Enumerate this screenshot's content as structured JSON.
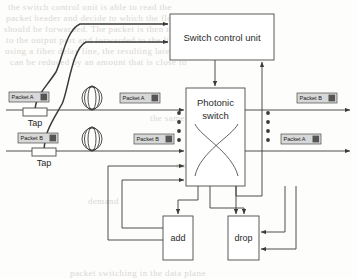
{
  "figure": {
    "type": "block-diagram"
  },
  "blocks": {
    "control_unit": {
      "label": "Switch control unit",
      "x": 170,
      "y": 14,
      "w": 104,
      "h": 46
    },
    "photonic_switch": {
      "label_line1": "Photonic",
      "label_line2": "switch",
      "x": 186,
      "y": 88,
      "w": 59,
      "h": 98
    },
    "add": {
      "label": "add",
      "x": 163,
      "y": 216,
      "w": 30,
      "h": 44
    },
    "drop": {
      "label": "drop",
      "x": 228,
      "y": 216,
      "w": 31,
      "h": 44
    }
  },
  "taps": [
    {
      "label": "Tap",
      "x": 23,
      "y": 108,
      "w": 24,
      "h": 8
    },
    {
      "label": "Tap",
      "x": 32,
      "y": 148,
      "w": 24,
      "h": 8
    }
  ],
  "packets": [
    {
      "id": "in-a",
      "label": "Packet A",
      "x": 9,
      "y": 92,
      "w": 40,
      "h": 10,
      "position": "input-line-1"
    },
    {
      "id": "in-b",
      "label": "Packet B",
      "x": 18,
      "y": 133,
      "w": 40,
      "h": 10,
      "position": "input-line-2"
    },
    {
      "id": "mid-a",
      "label": "Packet A",
      "x": 120,
      "y": 93,
      "w": 40,
      "h": 10,
      "position": "delayed-line-1"
    },
    {
      "id": "mid-b",
      "label": "Packet B",
      "x": 134,
      "y": 134,
      "w": 40,
      "h": 10,
      "position": "delayed-line-2"
    },
    {
      "id": "out-b",
      "label": "Packet B",
      "x": 297,
      "y": 93,
      "w": 40,
      "h": 10,
      "position": "output-line-1"
    },
    {
      "id": "out-a",
      "label": "Packet A",
      "x": 281,
      "y": 134,
      "w": 40,
      "h": 10,
      "position": "output-line-2"
    }
  ],
  "delay_coils": [
    {
      "id": "coil-1",
      "cx": 92,
      "cy": 98,
      "rx": 9,
      "ry": 12,
      "name": "fiber-delay-line-1"
    },
    {
      "id": "coil-2",
      "cx": 92,
      "cy": 139,
      "rx": 9,
      "ry": 12,
      "name": "fiber-delay-line-2"
    }
  ],
  "ellipsis": {
    "left": {
      "x": 179,
      "ys": [
        113,
        122,
        131,
        140
      ],
      "count": 4
    },
    "right": {
      "x": 268,
      "ys": [
        113,
        122,
        131,
        140
      ],
      "count": 4
    }
  },
  "colors": {
    "line": "#3a3a3a",
    "box_fill": "#ffffff",
    "box_stroke": "#4a4a4a",
    "packet_fill": "#d8d8d8",
    "packet_marker": "#555555",
    "text": "#1f1f1f",
    "background": "#fdfdfc",
    "bleed_text": "#cfcbc6"
  },
  "background_bleed": [
    {
      "text": "the switch control unit is able to read the",
      "x": 8,
      "y": 2
    },
    {
      "text": "packet header and decide to which the flow",
      "x": 6,
      "y": 13
    },
    {
      "text": "should be forwarded. The packet is then routed",
      "x": 4,
      "y": 24
    },
    {
      "text": "to the output port and forwarded to the link",
      "x": 6,
      "y": 35
    },
    {
      "text": "using a fiber delay line, the resulting latency of",
      "x": 5,
      "y": 46
    },
    {
      "text": "can be reduced by an amount that is close to",
      "x": 10,
      "y": 57
    },
    {
      "text": "the same",
      "x": 150,
      "y": 113
    },
    {
      "text": "node",
      "x": 176,
      "y": 160
    },
    {
      "text": "demand",
      "x": 88,
      "y": 196
    },
    {
      "text": "packet switching in the data plane",
      "x": 70,
      "y": 268
    }
  ]
}
